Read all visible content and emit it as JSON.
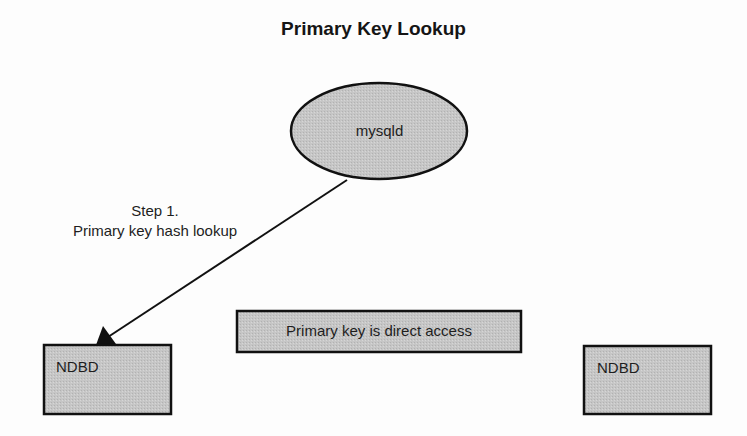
{
  "title": "Primary Key Lookup",
  "nodes": {
    "mysqld": {
      "label": "mysqld",
      "shape": "ellipse"
    },
    "ndbd_left": {
      "label": "NDBD",
      "shape": "rectangle"
    },
    "ndbd_right": {
      "label": "NDBD",
      "shape": "rectangle"
    },
    "note": {
      "label": "Primary key is direct access",
      "shape": "rectangle"
    }
  },
  "edges": [
    {
      "from": "mysqld",
      "to": "ndbd_left",
      "label_line1": "Step 1.",
      "label_line2": "Primary key hash lookup"
    }
  ],
  "colors": {
    "fill": "#c4c4c4",
    "stroke": "#111111",
    "background": "#fdfdfd"
  }
}
